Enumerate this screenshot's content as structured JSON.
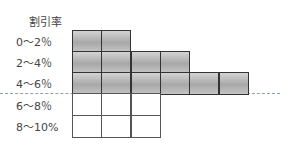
{
  "header": {
    "title": "割引率"
  },
  "rows": [
    {
      "label": "0～2％",
      "cells": 2,
      "filled": true
    },
    {
      "label": "2～4％",
      "cells": 4,
      "filled": true
    },
    {
      "label": "4～6％",
      "cells": 6,
      "filled": true
    },
    {
      "label": "6～8％",
      "cells": 3,
      "filled": false
    },
    {
      "label": "8～10%",
      "cells": 3,
      "filled": false
    }
  ],
  "colors": {
    "filled": "#b0b0b0",
    "grid": "#333333",
    "dashed_line": "#8aa0b4"
  }
}
